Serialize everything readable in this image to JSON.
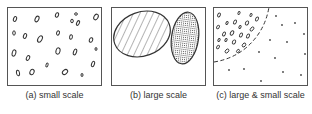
{
  "figure": {
    "panels": [
      {
        "id": "a",
        "caption": "(a) small scale",
        "content": "many small scattered ellipses"
      },
      {
        "id": "b",
        "caption": "(b) large scale",
        "content": "two large ellipses: one hatched, one dotted"
      },
      {
        "id": "c",
        "caption": "(c) large & small scale",
        "content": "cluster of small ellipses bounded by dashed arc, plus sparse dots"
      }
    ],
    "colors": {
      "stroke": "#333333",
      "background": "#ffffff",
      "dots": "#444444"
    }
  }
}
